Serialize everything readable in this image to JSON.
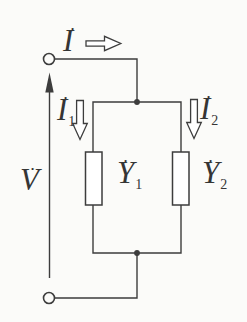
{
  "colors": {
    "background": "#fbfbf9",
    "line": "#3d3d3d",
    "text": "#353535",
    "dot_fill": "#2f2f2f"
  },
  "labels": {
    "source_current": {
      "dot": "•",
      "letter": "I",
      "sub": ""
    },
    "voltage": {
      "dot": "•",
      "letter": "V",
      "sub": ""
    },
    "branch1_current": {
      "dot": "•",
      "letter": "I",
      "sub": "1"
    },
    "branch2_current": {
      "dot": "•",
      "letter": "I",
      "sub": "2"
    },
    "admittance1": {
      "dot": "•",
      "letter": "Y",
      "sub": "1"
    },
    "admittance2": {
      "dot": "•",
      "letter": "Y",
      "sub": "2"
    }
  }
}
